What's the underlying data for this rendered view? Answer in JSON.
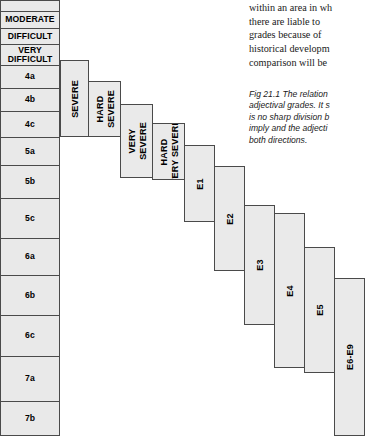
{
  "grade_scale": {
    "name": "adjectival-and-numerical-grade-scale",
    "cells": [
      {
        "label": "",
        "top": 0,
        "height": 12
      },
      {
        "label": "MODERATE",
        "top": 11,
        "height": 18
      },
      {
        "label": "DIFFICULT",
        "top": 28,
        "height": 17
      },
      {
        "label": "VERY\nDIFFICULT",
        "top": 44,
        "height": 22
      },
      {
        "label": "4a",
        "top": 65,
        "height": 24
      },
      {
        "label": "4b",
        "top": 88,
        "height": 24
      },
      {
        "label": "4c",
        "top": 111,
        "height": 27
      },
      {
        "label": "5a",
        "top": 137,
        "height": 29
      },
      {
        "label": "5b",
        "top": 165,
        "height": 34
      },
      {
        "label": "5c",
        "top": 198,
        "height": 41
      },
      {
        "label": "6a",
        "top": 238,
        "height": 38
      },
      {
        "label": "6b",
        "top": 275,
        "height": 41
      },
      {
        "label": "6c",
        "top": 315,
        "height": 42
      },
      {
        "label": "7a",
        "top": 356,
        "height": 46
      },
      {
        "label": "7b",
        "top": 401,
        "height": 35
      }
    ]
  },
  "technical_grades": {
    "name": "technical-grade-stair-steps",
    "boxes": [
      {
        "label": "SEVERE",
        "lines": [
          "SEVERE"
        ],
        "left": 60,
        "top": 60,
        "width": 29,
        "height": 77
      },
      {
        "label": "HARD SEVERE",
        "lines": [
          "HARD",
          "SEVERE"
        ],
        "left": 88,
        "top": 81,
        "width": 33,
        "height": 56
      },
      {
        "label": "VERY SEVERE",
        "lines": [
          "VERY",
          "SEVERE"
        ],
        "left": 120,
        "top": 104,
        "width": 33,
        "height": 74
      },
      {
        "label": "HARD VERY SEVERE",
        "lines": [
          "HARD",
          "VERY SEVERE"
        ],
        "left": 152,
        "top": 123,
        "width": 33,
        "height": 57
      },
      {
        "label": "E1",
        "lines": [
          "E1"
        ],
        "left": 184,
        "top": 145,
        "width": 31,
        "height": 77
      },
      {
        "label": "E2",
        "lines": [
          "E2"
        ],
        "left": 214,
        "top": 166,
        "width": 31,
        "height": 105
      },
      {
        "label": "E3",
        "lines": [
          "E3"
        ],
        "left": 244,
        "top": 205,
        "width": 31,
        "height": 120
      },
      {
        "label": "E4",
        "lines": [
          "E4"
        ],
        "left": 274,
        "top": 213,
        "width": 31,
        "height": 155
      },
      {
        "label": "E5",
        "lines": [
          "E5"
        ],
        "left": 304,
        "top": 247,
        "width": 31,
        "height": 126
      },
      {
        "label": "E6-E9",
        "lines": [
          "E6-E9"
        ],
        "left": 334,
        "top": 278,
        "width": 31,
        "height": 158
      }
    ]
  },
  "body_text": {
    "name": "surrounding-body-paragraph",
    "lines": [
      "within an area in wh",
      "there are liable to",
      "grades because of",
      "historical developm",
      "comparison will be"
    ],
    "text": "within an area in wh there are liable to grades because of historical developm comparison will be"
  },
  "figure_caption": {
    "name": "figure-caption",
    "label": "Fig 21.1",
    "lines": [
      "Fig 21.1 The relation",
      "adjectival grades. It s",
      "is no sharp division b",
      "imply and the adjecti",
      "both directions."
    ],
    "text": "Fig 21.1 The relation adjectival grades. It s is no sharp division b imply and the adjecti both directions."
  },
  "colors": {
    "box_fill": "#eaeaea",
    "box_border": "#4a4a4a",
    "page_background": "#ffffff",
    "text": "#000000"
  }
}
